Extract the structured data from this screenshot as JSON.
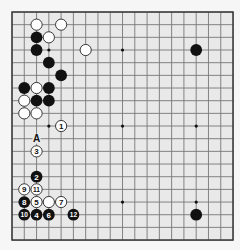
{
  "board": {
    "size": 19,
    "origin_x": 12,
    "origin_y": 12,
    "spacing_x": 12.28,
    "spacing_y": 12.67,
    "board_color": "#e9e9e9",
    "line_color": "#777777",
    "border_color": "#333333",
    "black_color": "#111111",
    "white_color": "#ffffff",
    "star_points": [
      [
        3,
        3
      ],
      [
        9,
        3
      ],
      [
        15,
        3
      ],
      [
        3,
        9
      ],
      [
        9,
        9
      ],
      [
        15,
        9
      ],
      [
        3,
        15
      ],
      [
        9,
        15
      ],
      [
        15,
        15
      ]
    ]
  },
  "stones": [
    {
      "color": "white",
      "col": 2,
      "row": 1,
      "label": ""
    },
    {
      "color": "white",
      "col": 4,
      "row": 1,
      "label": ""
    },
    {
      "color": "black",
      "col": 2,
      "row": 2,
      "label": ""
    },
    {
      "color": "white",
      "col": 3,
      "row": 2,
      "label": ""
    },
    {
      "color": "black",
      "col": 2,
      "row": 3,
      "label": ""
    },
    {
      "color": "white",
      "col": 6,
      "row": 3,
      "label": ""
    },
    {
      "color": "black",
      "col": 15,
      "row": 3,
      "label": ""
    },
    {
      "color": "black",
      "col": 3,
      "row": 4,
      "label": ""
    },
    {
      "color": "black",
      "col": 4,
      "row": 5,
      "label": ""
    },
    {
      "color": "black",
      "col": 1,
      "row": 6,
      "label": ""
    },
    {
      "color": "white",
      "col": 2,
      "row": 6,
      "label": ""
    },
    {
      "color": "black",
      "col": 3,
      "row": 6,
      "label": ""
    },
    {
      "color": "white",
      "col": 1,
      "row": 7,
      "label": ""
    },
    {
      "color": "black",
      "col": 2,
      "row": 7,
      "label": ""
    },
    {
      "color": "black",
      "col": 3,
      "row": 7,
      "label": ""
    },
    {
      "color": "white",
      "col": 1,
      "row": 8,
      "label": ""
    },
    {
      "color": "white",
      "col": 2,
      "row": 8,
      "label": ""
    },
    {
      "color": "white",
      "col": 4,
      "row": 9,
      "label": "1"
    },
    {
      "color": "white",
      "col": 2,
      "row": 11,
      "label": "3"
    },
    {
      "color": "black",
      "col": 2,
      "row": 13,
      "label": "2"
    },
    {
      "color": "white",
      "col": 1,
      "row": 14,
      "label": "9"
    },
    {
      "color": "white",
      "col": 2,
      "row": 14,
      "label": "11"
    },
    {
      "color": "black",
      "col": 1,
      "row": 15,
      "label": "8"
    },
    {
      "color": "white",
      "col": 2,
      "row": 15,
      "label": "5"
    },
    {
      "color": "white",
      "col": 3,
      "row": 15,
      "label": ""
    },
    {
      "color": "white",
      "col": 4,
      "row": 15,
      "label": "7"
    },
    {
      "color": "black",
      "col": 1,
      "row": 16,
      "label": "10"
    },
    {
      "color": "black",
      "col": 2,
      "row": 16,
      "label": "4"
    },
    {
      "color": "black",
      "col": 3,
      "row": 16,
      "label": "6"
    },
    {
      "color": "black",
      "col": 5,
      "row": 16,
      "label": "12"
    },
    {
      "color": "black",
      "col": 15,
      "row": 16,
      "label": ""
    }
  ],
  "markers": [
    {
      "type": "letter",
      "col": 2,
      "row": 10,
      "label": "A"
    }
  ]
}
